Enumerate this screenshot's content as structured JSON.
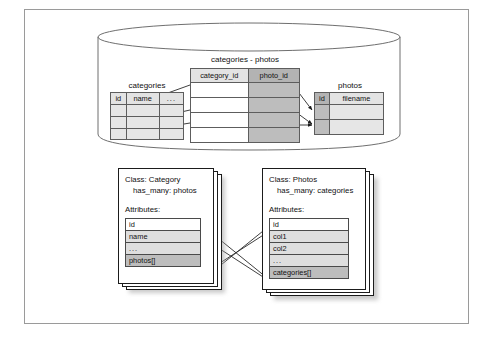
{
  "figure": {
    "border_color": "#9a9a9a"
  },
  "database": {
    "shape": "cylinder",
    "label": "database",
    "tables": [
      {
        "name": "categories",
        "caption": "categories",
        "columns": [
          "id",
          "name",
          "..."
        ],
        "column_shading": [
          "plain",
          "plain",
          "plain"
        ],
        "row_count": 3,
        "row_shading": [
          "lite",
          "lite",
          "lite"
        ]
      },
      {
        "name": "categories - photos",
        "caption": "categories - photos",
        "columns": [
          "category_id",
          "photo_id"
        ],
        "column_shading": [
          "plain",
          "shade"
        ],
        "row_count": 4,
        "row_shading": [
          "plain",
          "plain",
          "plain",
          "plain"
        ]
      },
      {
        "name": "photos",
        "caption": "photos",
        "columns": [
          "id",
          "filename"
        ],
        "column_shading": [
          "shade",
          "plain"
        ],
        "row_count": 2,
        "row_shading": [
          "lite",
          "lite"
        ]
      }
    ]
  },
  "classes": [
    {
      "id": "category",
      "title_line1": "Class: Category",
      "title_line2": "has_many: photos",
      "attributes_label": "Attributes:",
      "attributes": [
        "id",
        "name",
        "...",
        "photos[]"
      ],
      "attribute_shading": [
        "white",
        "grey",
        "grey",
        "dark"
      ]
    },
    {
      "id": "photos",
      "title_line1": "Class: Photos",
      "title_line2": "has_many: categories",
      "attributes_label": "Attributes:",
      "attributes": [
        "id",
        "col1",
        "col2",
        "...",
        "categories[]"
      ],
      "attribute_shading": [
        "white",
        "grey",
        "grey",
        "grey",
        "dark"
      ]
    }
  ],
  "connectors": {
    "join_to_categories": "category_id rows point back to categories.id rows",
    "join_to_photos": "photo_id rows point to photos.id rows",
    "category_photos_to_photos_class": "Category.photos[] points to Class: Photos",
    "photos_categories_to_category_class": "Photos.categories[] points to Class: Category"
  },
  "colors": {
    "line": "#1b1b1b",
    "header_fill": "#e3e3e3",
    "header_fill_dark": "#b3b3b3",
    "shade_fill": "#bdbdbd",
    "lite_fill": "#e6e6e6",
    "cylinder_stroke": "#6f6f6f"
  }
}
